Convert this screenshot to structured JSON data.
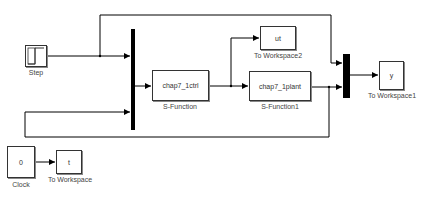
{
  "diagram": {
    "type": "simulink-block-diagram",
    "blocks": {
      "step": {
        "label": "Step"
      },
      "mux1": {
        "label": ""
      },
      "ctrl": {
        "content": "chap7_1ctrl",
        "label": "S-Function"
      },
      "ut": {
        "content": "ut",
        "label": "To Workspace2"
      },
      "plant": {
        "content": "chap7_1plant",
        "label": "S-Function1"
      },
      "mux2": {
        "label": ""
      },
      "y": {
        "content": "y",
        "label": "To Workspace1"
      },
      "clock": {
        "content": "0",
        "label": "Clock"
      },
      "t": {
        "content": "t",
        "label": "To Workspace"
      }
    },
    "connections": [
      {
        "from": "step",
        "to": "mux1",
        "port": 1
      },
      {
        "from": "step",
        "to": "mux2",
        "port": 1
      },
      {
        "from": "mux1",
        "to": "ctrl"
      },
      {
        "from": "ctrl",
        "to": "ut"
      },
      {
        "from": "ctrl",
        "to": "plant"
      },
      {
        "from": "plant",
        "to": "mux2",
        "port": 2
      },
      {
        "from": "plant",
        "to": "mux1",
        "port": 2
      },
      {
        "from": "mux2",
        "to": "y"
      },
      {
        "from": "clock",
        "to": "t"
      }
    ]
  }
}
